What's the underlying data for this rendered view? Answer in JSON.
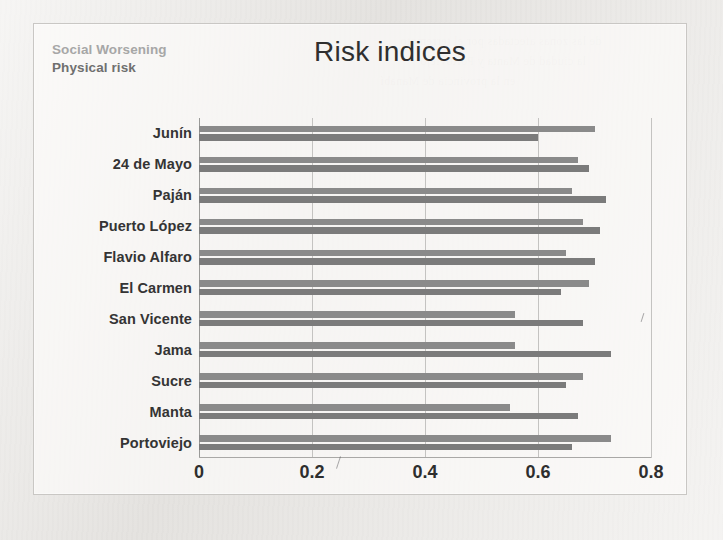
{
  "legend": {
    "social_label": "Social Worsening",
    "physical_label": "Physical risk",
    "social_color": "#a7a7a7",
    "physical_color": "#6f6f6f"
  },
  "title": "Risk indices",
  "chart_data": {
    "type": "bar",
    "orientation": "horizontal",
    "title": "Risk indices",
    "xlabel": "",
    "ylabel": "",
    "xlim": [
      0,
      0.8
    ],
    "xticks": [
      "0",
      "0.2",
      "0.4",
      "0.6",
      "0.8"
    ],
    "xtick_values": [
      0,
      0.2,
      0.4,
      0.6,
      0.8
    ],
    "grid": true,
    "legend_position": "top-left",
    "categories": [
      "Junín",
      "24 de Mayo",
      "Paján",
      "Puerto López",
      "Flavio Alfaro",
      "El Carmen",
      "San Vicente",
      "Jama",
      "Sucre",
      "Manta",
      "Portoviejo"
    ],
    "series": [
      {
        "name": "Social Worsening",
        "color": "#8a8a8a",
        "values": [
          0.7,
          0.67,
          0.66,
          0.68,
          0.65,
          0.69,
          0.56,
          0.56,
          0.68,
          0.55,
          0.73
        ]
      },
      {
        "name": "Physical risk",
        "color": "#7b7b7b",
        "values": [
          0.6,
          0.69,
          0.72,
          0.71,
          0.7,
          0.64,
          0.68,
          0.73,
          0.65,
          0.67,
          0.66
        ]
      }
    ]
  },
  "ghost_text": [
    "de las zonas afectadas por el terremoto",
    "la ciudad de Manta y Portoviejo",
    "en la provincia de Manabí"
  ]
}
